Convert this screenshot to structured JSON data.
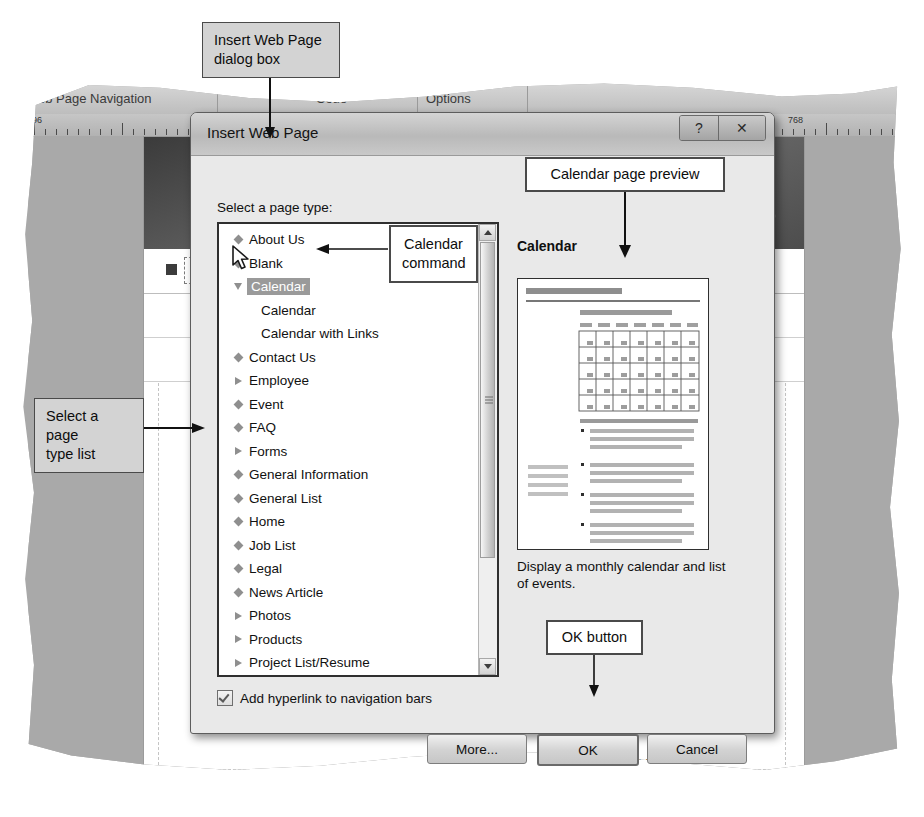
{
  "annotations": {
    "dialog_label": "Insert Web Page\ndialog box",
    "list_label": "Select a page\ntype list",
    "command_label": "Calendar\ncommand",
    "preview_label": "Calendar page preview",
    "ok_label": "OK button"
  },
  "ribbon": {
    "tabs": [
      {
        "label": "Web Page Navigation"
      },
      {
        "label": "Code"
      },
      {
        "label": "Options"
      }
    ],
    "ghost_labels": [
      {
        "label": "Bar"
      },
      {
        "label": "ptions"
      }
    ]
  },
  "ruler": {
    "marks": [
      {
        "label": "96"
      },
      {
        "label": "0"
      },
      {
        "label": "768"
      }
    ]
  },
  "document": {
    "nav_home_label": "Home",
    "text_fragments": [
      {
        "text": "o·"
      },
      {
        "text": "nd·"
      },
      {
        "text": "ty.·"
      },
      {
        "text": "lth.·"
      }
    ]
  },
  "dialog": {
    "title": "Insert Web Page",
    "help_button": "?",
    "close_button": "✕",
    "list_label": "Select a page type:",
    "page_types": [
      {
        "label": "About Us",
        "glyph": "diamond",
        "indent": 0,
        "selected": false
      },
      {
        "label": "Blank",
        "glyph": "diamond",
        "indent": 0,
        "selected": false
      },
      {
        "label": "Calendar",
        "glyph": "triangle-down",
        "indent": 0,
        "selected": true
      },
      {
        "label": "Calendar",
        "glyph": "none",
        "indent": 1,
        "selected": false
      },
      {
        "label": "Calendar with Links",
        "glyph": "none",
        "indent": 1,
        "selected": false
      },
      {
        "label": "Contact Us",
        "glyph": "diamond",
        "indent": 0,
        "selected": false
      },
      {
        "label": "Employee",
        "glyph": "triangle-right",
        "indent": 0,
        "selected": false
      },
      {
        "label": "Event",
        "glyph": "diamond",
        "indent": 0,
        "selected": false
      },
      {
        "label": "FAQ",
        "glyph": "diamond",
        "indent": 0,
        "selected": false
      },
      {
        "label": "Forms",
        "glyph": "triangle-right",
        "indent": 0,
        "selected": false
      },
      {
        "label": "General Information",
        "glyph": "diamond",
        "indent": 0,
        "selected": false
      },
      {
        "label": "General List",
        "glyph": "diamond",
        "indent": 0,
        "selected": false
      },
      {
        "label": "Home",
        "glyph": "diamond",
        "indent": 0,
        "selected": false
      },
      {
        "label": "Job List",
        "glyph": "diamond",
        "indent": 0,
        "selected": false
      },
      {
        "label": "Legal",
        "glyph": "diamond",
        "indent": 0,
        "selected": false
      },
      {
        "label": "News Article",
        "glyph": "diamond",
        "indent": 0,
        "selected": false
      },
      {
        "label": "Photos",
        "glyph": "triangle-right",
        "indent": 0,
        "selected": false
      },
      {
        "label": "Products",
        "glyph": "triangle-right",
        "indent": 0,
        "selected": false
      },
      {
        "label": "Project List/Resume",
        "glyph": "triangle-right",
        "indent": 0,
        "selected": false
      },
      {
        "label": "Related Links",
        "glyph": "diamond",
        "indent": 0,
        "selected": false
      },
      {
        "label": "Services",
        "glyph": "triangle-right",
        "indent": 0,
        "selected": false
      }
    ],
    "preview_title": "Calendar",
    "preview_description": "Display a monthly calendar and list of events.",
    "checkbox_label": "Add hyperlink to navigation bars",
    "checkbox_checked": true,
    "buttons": {
      "more": "More...",
      "ok": "OK",
      "cancel": "Cancel"
    }
  }
}
